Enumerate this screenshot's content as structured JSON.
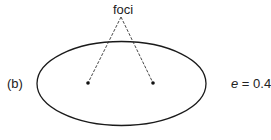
{
  "diagram": {
    "panel_label": "(b)",
    "foci_label": "foci",
    "eccentricity": {
      "variable": "e",
      "equals": " = ",
      "value": "0.4"
    },
    "colors": {
      "stroke": "#1a1a1a",
      "background": "#ffffff"
    },
    "ellipse": {
      "cx": 121.5,
      "cy": 83.5,
      "rx": 84.5,
      "ry": 42
    },
    "foci": [
      {
        "x": 88,
        "y": 83
      },
      {
        "x": 153,
        "y": 83
      }
    ],
    "label_anchor": {
      "x": 121,
      "y": 17
    }
  }
}
